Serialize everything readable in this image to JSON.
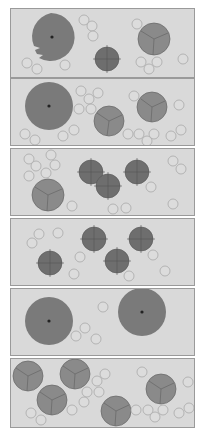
{
  "colors": {
    "background": "#ffffff",
    "panel_bg": "#d9d9d9",
    "panel_border": "#9a9a9a",
    "large_cell": "#7a7a7a",
    "segmented_cell": "#8a8a8a",
    "spiky_cell": "#6e6e6e",
    "small_cell_fill": "#dcdcdc",
    "small_cell_stroke": "#a8a8a8"
  },
  "panels": [
    {
      "id": "panel-1",
      "top": 8,
      "height": 70
    },
    {
      "id": "panel-2",
      "top": 78,
      "height": 68
    },
    {
      "id": "panel-3",
      "top": 148,
      "height": 68
    },
    {
      "id": "panel-4",
      "top": 218,
      "height": 68
    },
    {
      "id": "panel-5",
      "top": 288,
      "height": 68
    },
    {
      "id": "panel-6",
      "top": 358,
      "height": 70
    }
  ]
}
